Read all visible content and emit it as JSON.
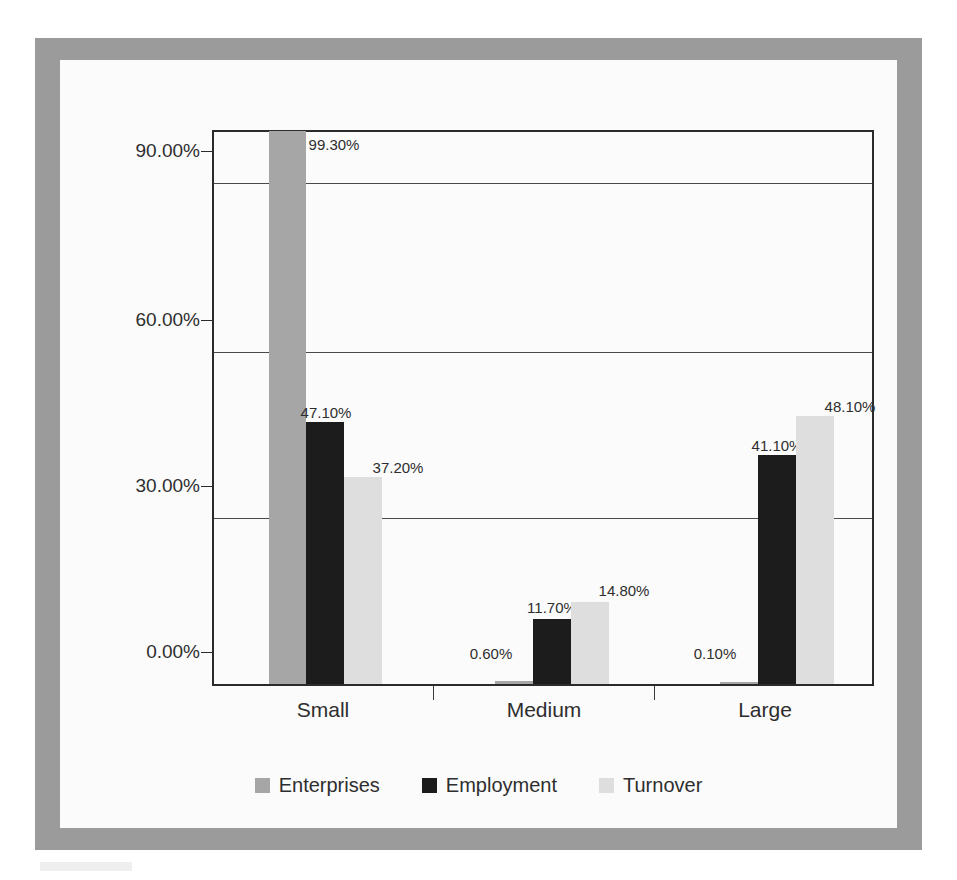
{
  "chart_data": {
    "type": "bar",
    "title": "",
    "subtitle": "",
    "xlabel": "",
    "ylabel": "",
    "categories": [
      "Small",
      "Medium",
      "Large"
    ],
    "series": [
      {
        "name": "Enterprises",
        "color": "#a6a6a6",
        "values": [
          99.3,
          0.6,
          0.1
        ],
        "labels": [
          "99.30%",
          "0.60%",
          "0.10%"
        ]
      },
      {
        "name": "Employment",
        "color": "#1c1c1c",
        "values": [
          47.1,
          11.7,
          41.1
        ],
        "labels": [
          "47.10%",
          "11.70%",
          "41.10%"
        ]
      },
      {
        "name": "Turnover",
        "color": "#dedede",
        "values": [
          37.2,
          14.8,
          48.1
        ],
        "labels": [
          "37.20%",
          "14.80%",
          "48.10%"
        ]
      }
    ],
    "ylim": [
      0,
      100
    ],
    "yticks": [
      0,
      30,
      60,
      90
    ],
    "ytick_labels": [
      "0.00%",
      "30.00%",
      "60.00%",
      "90.00%"
    ],
    "grid": true,
    "legend_position": "bottom",
    "value_labels": true,
    "units": "percent"
  },
  "legend": {
    "items": [
      {
        "label": "Enterprises",
        "color": "#a6a6a6"
      },
      {
        "label": "Employment",
        "color": "#1c1c1c"
      },
      {
        "label": "Turnover",
        "color": "#dedede"
      }
    ]
  },
  "frame": {
    "border_color": "#9b9b9b",
    "canvas_color": "#fbfbfb",
    "axis_color": "#2b2b2b"
  }
}
